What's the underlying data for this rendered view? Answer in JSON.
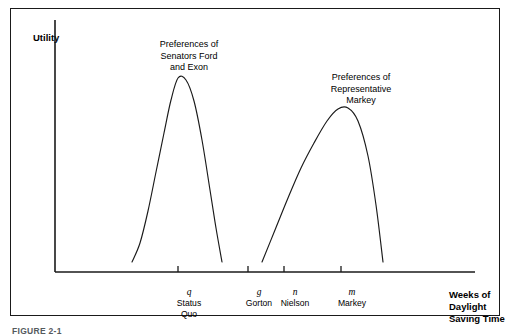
{
  "figure": {
    "caption": "FIGURE 2-1",
    "background_color": "#ffffff",
    "line_color": "#1a1a1a"
  },
  "axes": {
    "y_title": "Utility",
    "x_title_lines": [
      "Weeks of",
      "Daylight",
      "Saving Time"
    ]
  },
  "annotations": [
    {
      "id": "senators",
      "lines": [
        "Preferences of",
        "Senators Ford",
        "and Exon"
      ]
    },
    {
      "id": "markey",
      "lines": [
        "Preferences of",
        "Representative",
        "Markey"
      ]
    }
  ],
  "ticks": [
    {
      "symbol": "q",
      "name": "Status\nQuo"
    },
    {
      "symbol": "g",
      "name": "Gorton"
    },
    {
      "symbol": "n",
      "name": "Nielson"
    },
    {
      "symbol": "m",
      "name": "Markey"
    }
  ],
  "chart_data": {
    "type": "line",
    "title": "",
    "xlabel": "Weeks of Daylight Saving Time",
    "ylabel": "Utility",
    "grid": false,
    "legend": "none",
    "axis_style": "open (left and bottom spines only, no numeric scale)",
    "x_tick_labels": [
      "q",
      "g",
      "n",
      "m"
    ],
    "x_tick_sublabels": [
      "Status Quo",
      "Gorton",
      "Nielson",
      "Markey"
    ],
    "x_tick_positions": [
      178,
      248,
      284,
      341
    ],
    "xlim": [
      55,
      475
    ],
    "ylim_pixels": [
      272,
      20
    ],
    "series": [
      {
        "name": "Preferences of Senators Ford and Exon",
        "shape": "single-peaked, near symmetric bell",
        "peak_x_label": "q",
        "peak_x": 178,
        "peak_y_px": 78,
        "left_base_x": 132,
        "right_base_x": 222,
        "base_y_px": 262,
        "points": [
          [
            132,
            262
          ],
          [
            140,
            243
          ],
          [
            148,
            211
          ],
          [
            156,
            172
          ],
          [
            164,
            133
          ],
          [
            171,
            100
          ],
          [
            178,
            78
          ],
          [
            186,
            80
          ],
          [
            194,
            101
          ],
          [
            202,
            140
          ],
          [
            210,
            190
          ],
          [
            216,
            228
          ],
          [
            222,
            262
          ]
        ]
      },
      {
        "name": "Preferences of Representative Markey",
        "shape": "single-peaked, skewed left (gradual rise, steep fall)",
        "peak_x_label": "m",
        "peak_x": 343,
        "peak_y_px": 107,
        "left_base_x": 262,
        "right_base_x": 383,
        "base_y_px": 262,
        "points": [
          [
            262,
            262
          ],
          [
            275,
            230
          ],
          [
            288,
            198
          ],
          [
            301,
            168
          ],
          [
            314,
            143
          ],
          [
            327,
            121
          ],
          [
            338,
            109
          ],
          [
            348,
            108
          ],
          [
            358,
            121
          ],
          [
            368,
            156
          ],
          [
            376,
            205
          ],
          [
            383,
            262
          ]
        ]
      }
    ]
  }
}
